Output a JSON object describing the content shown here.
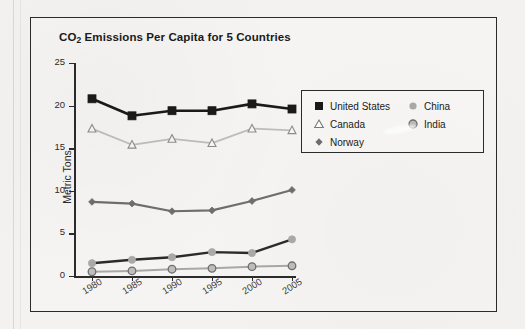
{
  "chart_data": {
    "type": "line",
    "title": "CO2 Emissions Per Capita for 5 Countries",
    "title_main": "CO",
    "title_sub": "2",
    "title_rest": " Emissions Per Capita for 5 Countries",
    "xlabel": "",
    "ylabel": "Metric Tons",
    "categories": [
      "1980",
      "1985",
      "1990",
      "1995",
      "2000",
      "2005"
    ],
    "ylim": [
      0,
      25
    ],
    "yticks": [
      "0",
      "5",
      "10",
      "15",
      "20",
      "25"
    ],
    "grid": false,
    "legend_position": "right",
    "series": [
      {
        "name": "United States",
        "marker": "filled-square",
        "color": "#1a1a1a",
        "values": [
          20.8,
          18.8,
          19.4,
          19.4,
          20.2,
          19.6
        ]
      },
      {
        "name": "Canada",
        "marker": "open-triangle",
        "color": "#b3b3b3",
        "values": [
          17.3,
          15.4,
          16.1,
          15.6,
          17.3,
          17.1
        ]
      },
      {
        "name": "Norway",
        "marker": "diamond",
        "color": "#6e6e6e",
        "values": [
          8.7,
          8.5,
          7.6,
          7.7,
          8.8,
          10.1
        ]
      },
      {
        "name": "China",
        "marker": "light-circle",
        "color": "#2b2b2b",
        "values": [
          1.5,
          1.9,
          2.2,
          2.8,
          2.7,
          4.3
        ]
      },
      {
        "name": "India",
        "marker": "ring-circle",
        "color": "#9a9a9a",
        "values": [
          0.5,
          0.6,
          0.8,
          0.9,
          1.1,
          1.2
        ]
      }
    ]
  },
  "legend": {
    "left_items": [
      "United States",
      "Canada",
      "Norway"
    ],
    "right_items": [
      "China",
      "India"
    ]
  },
  "colors": {
    "accent_dark": "#1a1a1a",
    "canada_gray": "#b3b3b3",
    "norway_gray": "#6e6e6e",
    "china_marker": "#a9a9a9",
    "india_marker": "#9a9a9a",
    "frame": "#2b2b2b",
    "paper": "#f3f2f0"
  }
}
